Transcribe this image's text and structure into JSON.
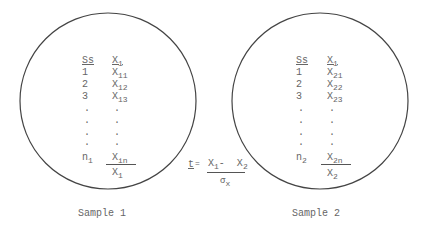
{
  "samples": [
    {
      "label": "Sample 1",
      "col_ss_header": "Ss",
      "col_x_header": "X",
      "col_x_header_sub": "1",
      "rows": [
        {
          "ss": "1",
          "x": "X",
          "x_sub": "11"
        },
        {
          "ss": "2",
          "x": "X",
          "x_sub": "12"
        },
        {
          "ss": "3",
          "x": "X",
          "x_sub": "13"
        },
        {
          "ss": ".",
          "x": "."
        },
        {
          "ss": ".",
          "x": "."
        },
        {
          "ss": ".",
          "x": "."
        },
        {
          "ss": ".",
          "x": "."
        }
      ],
      "last_ss": "n",
      "last_ss_sub": "1",
      "last_x": "X",
      "last_x_sub": "in",
      "mean": "X",
      "mean_sub": "1"
    },
    {
      "label": "Sample 2",
      "col_ss_header": "Ss",
      "col_x_header": "X",
      "col_x_header_sub": "1",
      "rows": [
        {
          "ss": "1",
          "x": "X",
          "x_sub": "21"
        },
        {
          "ss": "2",
          "x": "X",
          "x_sub": "22"
        },
        {
          "ss": "3",
          "x": "X",
          "x_sub": "23"
        },
        {
          "ss": ".",
          "x": "."
        },
        {
          "ss": ".",
          "x": "."
        },
        {
          "ss": ".",
          "x": "."
        },
        {
          "ss": ".",
          "x": "."
        }
      ],
      "last_ss": "n",
      "last_ss_sub": "2",
      "last_x": "X",
      "last_x_sub": "2n",
      "mean": "X",
      "mean_sub": "2"
    }
  ],
  "formula": {
    "lhs": "t",
    "eq": "=",
    "num_a": "X",
    "num_a_sub": "1",
    "minus": "-",
    "num_b": "X",
    "num_b_sub": "2",
    "den": "σ",
    "den_sub": "x"
  }
}
